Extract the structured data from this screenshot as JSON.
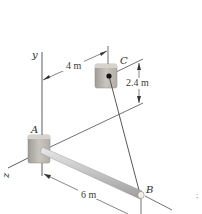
{
  "diagram": {
    "type": "statics-3d-boom-cable",
    "points": {
      "A": {
        "label": "A",
        "description": "ball-and-socket / fixed support on y-axis"
      },
      "B": {
        "label": "B",
        "description": "end of boom"
      },
      "C": {
        "label": "C",
        "description": "cable anchor on wall"
      }
    },
    "axes": {
      "y": "y",
      "z": "z"
    },
    "dimensions": {
      "horizontal_offset_C": "4 m",
      "vertical_offset_C": "2.4 m",
      "boom_length": "6 m"
    },
    "members": [
      {
        "name": "boom",
        "from": "A",
        "to": "B"
      },
      {
        "name": "cable",
        "from": "C",
        "to": "B"
      }
    ],
    "colors": {
      "support": "#b9b4ad",
      "boom": "#c8c8c8",
      "line": "#333333",
      "pin": "#111111"
    }
  }
}
